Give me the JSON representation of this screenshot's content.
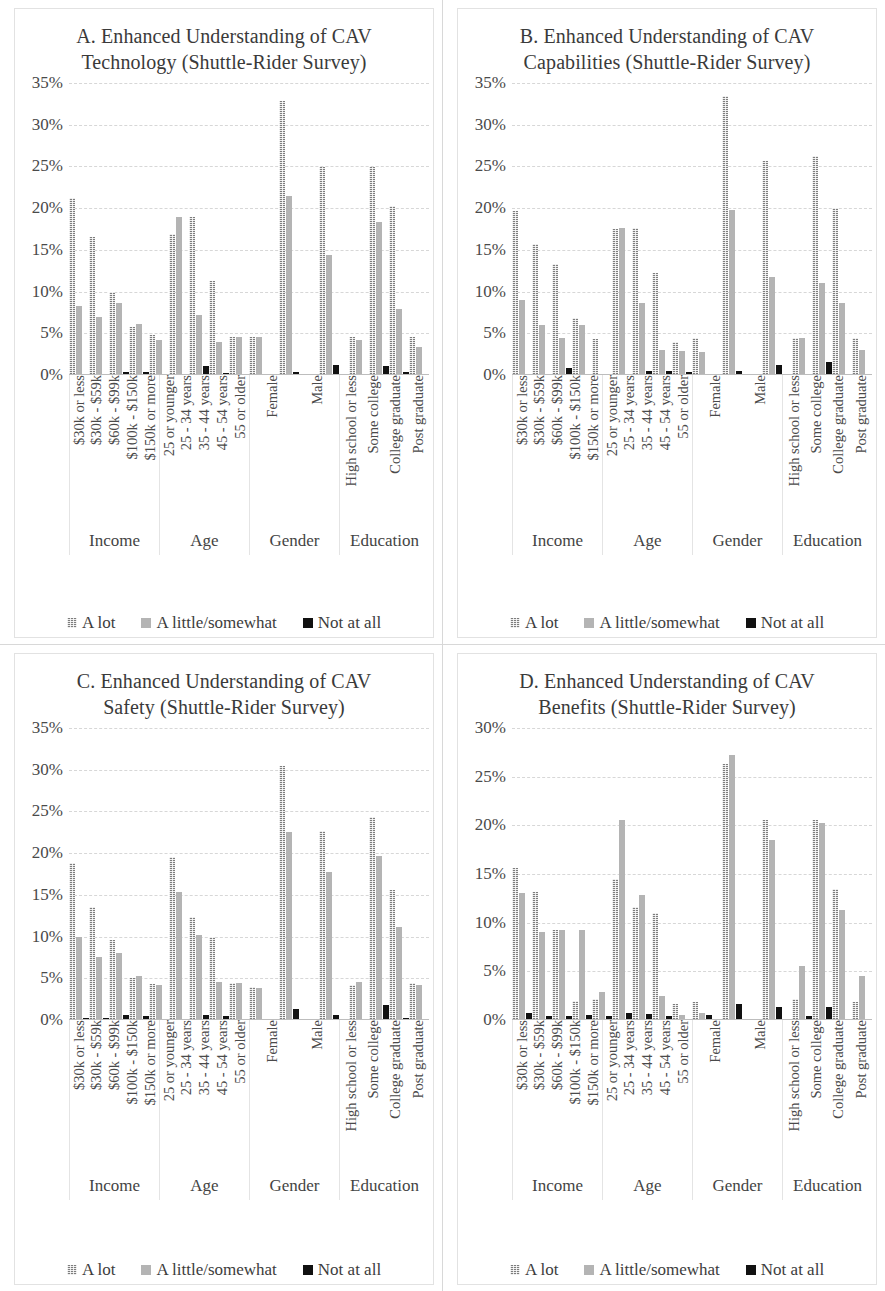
{
  "figure": {
    "legend": [
      {
        "label": "A lot",
        "key": "alot",
        "style": "hatched-gray",
        "color": "#7d7d7d"
      },
      {
        "label": "A little/somewhat",
        "key": "little",
        "style": "solid-light-gray",
        "color": "#b4b4b4"
      },
      {
        "label": "Not at all",
        "key": "none",
        "style": "solid-black",
        "color": "#111111"
      }
    ],
    "groups": [
      {
        "name": "Income",
        "categories": [
          "$30k or less",
          "$30k - $59k",
          "$60k - $99k",
          "$100k - $150k",
          "$150k or more"
        ]
      },
      {
        "name": "Age",
        "categories": [
          "25 or younger",
          "25 - 34 years",
          "35 - 44 years",
          "45 - 54 years",
          "55 or older"
        ]
      },
      {
        "name": "Gender",
        "categories": [
          "Female",
          "Male"
        ]
      },
      {
        "name": "Education",
        "categories": [
          "High school or less",
          "Some college",
          "College graduate",
          "Post graduate"
        ]
      }
    ]
  },
  "chart_data": [
    {
      "id": "A",
      "type": "bar",
      "title": "A. Enhanced Understanding of CAV Technology (Shuttle-Rider Survey)",
      "xlabel": "",
      "ylabel": "",
      "ylim": [
        0,
        35
      ],
      "yticks": [
        "0%",
        "5%",
        "10%",
        "15%",
        "20%",
        "25%",
        "30%",
        "35%"
      ],
      "ytick_values": [
        0,
        5,
        10,
        15,
        20,
        25,
        30,
        35
      ],
      "grid": true,
      "legend_position": "bottom",
      "categories": [
        "$30k or less",
        "$30k - $59k",
        "$60k - $99k",
        "$100k - $150k",
        "$150k or more",
        "25 or younger",
        "25 - 34 years",
        "35 - 44 years",
        "45 - 54 years",
        "55 or older",
        "Female",
        "Male",
        "High school or less",
        "Some college",
        "College graduate",
        "Post graduate"
      ],
      "series": [
        {
          "name": "A lot",
          "values": [
            21.2,
            16.6,
            9.9,
            5.7,
            4.8,
            16.9,
            18.9,
            11.3,
            4.6,
            4.5,
            32.8,
            24.9,
            4.5,
            24.9,
            20.2,
            4.6
          ]
        },
        {
          "name": "A little/somewhat",
          "values": [
            8.3,
            6.9,
            8.6,
            6.1,
            4.2,
            18.9,
            7.2,
            4.0,
            4.5,
            4.6,
            21.5,
            14.4,
            4.2,
            18.3,
            7.9,
            3.3
          ]
        },
        {
          "name": "Not at all",
          "values": [
            0,
            0,
            0.4,
            0.4,
            0,
            0,
            1.1,
            0.3,
            0,
            0,
            0.4,
            1.2,
            0,
            1.1,
            0.4,
            0
          ]
        }
      ]
    },
    {
      "id": "B",
      "type": "bar",
      "title": "B. Enhanced Understanding of CAV Capabilities (Shuttle-Rider Survey)",
      "xlabel": "",
      "ylabel": "",
      "ylim": [
        0,
        35
      ],
      "yticks": [
        "0%",
        "5%",
        "10%",
        "15%",
        "20%",
        "25%",
        "30%",
        "35%"
      ],
      "ytick_values": [
        0,
        5,
        10,
        15,
        20,
        25,
        30,
        35
      ],
      "grid": true,
      "legend_position": "bottom",
      "categories": [
        "$30k or less",
        "$30k - $59k",
        "$60k - $99k",
        "$100k - $150k",
        "$150k or more",
        "25 or younger",
        "25 - 34 years",
        "35 - 44 years",
        "45 - 54 years",
        "55 or older",
        "Female",
        "Male",
        "High school or less",
        "Some college",
        "College graduate",
        "Post graduate"
      ],
      "series": [
        {
          "name": "A lot",
          "values": [
            19.7,
            15.7,
            13.3,
            6.8,
            4.3,
            17.5,
            17.6,
            12.2,
            4.0,
            4.4,
            33.4,
            25.6,
            4.4,
            26.2,
            20.0,
            4.4
          ]
        },
        {
          "name": "A little/somewhat",
          "values": [
            9.0,
            6.0,
            4.4,
            6.0,
            0,
            17.6,
            8.6,
            3.0,
            2.9,
            2.8,
            19.8,
            11.8,
            4.4,
            11.0,
            8.6,
            3.0
          ]
        },
        {
          "name": "Not at all",
          "values": [
            0,
            0,
            0.8,
            0,
            0,
            0,
            0.5,
            0.5,
            0.4,
            0,
            0.5,
            1.2,
            0,
            1.6,
            0,
            0
          ]
        }
      ]
    },
    {
      "id": "C",
      "type": "bar",
      "title": "C. Enhanced Understanding of CAV Safety (Shuttle-Rider Survey)",
      "xlabel": "",
      "ylabel": "",
      "ylim": [
        0,
        35
      ],
      "yticks": [
        "0%",
        "5%",
        "10%",
        "15%",
        "20%",
        "25%",
        "30%",
        "35%"
      ],
      "ytick_values": [
        0,
        5,
        10,
        15,
        20,
        25,
        30,
        35
      ],
      "grid": true,
      "legend_position": "bottom",
      "categories": [
        "$30k or less",
        "$30k - $59k",
        "$60k - $99k",
        "$100k - $150k",
        "$150k or more",
        "25 or younger",
        "25 - 34 years",
        "35 - 44 years",
        "45 - 54 years",
        "55 or older",
        "Female",
        "Male",
        "High school or less",
        "Some college",
        "College graduate",
        "Post graduate"
      ],
      "series": [
        {
          "name": "A lot",
          "values": [
            18.8,
            13.6,
            9.6,
            5.0,
            4.3,
            19.5,
            12.4,
            10.0,
            4.4,
            4.0,
            30.5,
            22.7,
            4.2,
            24.3,
            15.6,
            4.4
          ]
        },
        {
          "name": "A little/somewhat",
          "values": [
            9.9,
            7.6,
            8.0,
            5.3,
            4.2,
            15.3,
            10.2,
            4.5,
            4.4,
            3.8,
            22.5,
            17.7,
            4.5,
            19.7,
            11.2,
            4.2
          ]
        },
        {
          "name": "Not at all",
          "values": [
            0.3,
            0.3,
            0.6,
            0.5,
            0,
            0,
            0.6,
            0.5,
            0,
            0,
            1.3,
            0.6,
            0,
            1.8,
            0.3,
            0
          ]
        }
      ]
    },
    {
      "id": "D",
      "type": "bar",
      "title": "D. Enhanced Understanding of CAV Benefits (Shuttle-Rider Survey)",
      "xlabel": "",
      "ylabel": "",
      "ylim": [
        0,
        30
      ],
      "yticks": [
        "0%",
        "5%",
        "10%",
        "15%",
        "20%",
        "25%",
        "30%"
      ],
      "ytick_values": [
        0,
        5,
        10,
        15,
        20,
        25,
        30
      ],
      "grid": true,
      "legend_position": "bottom",
      "categories": [
        "$30k or less",
        "$30k - $59k",
        "$60k - $99k",
        "$100k - $150k",
        "$150k or more",
        "25 or younger",
        "25 - 34 years",
        "35 - 44 years",
        "45 - 54 years",
        "55 or older",
        "Female",
        "Male",
        "High school or less",
        "Some college",
        "College graduate",
        "Post graduate"
      ],
      "series": [
        {
          "name": "A lot",
          "values": [
            15.6,
            13.2,
            9.2,
            2.0,
            2.2,
            14.5,
            11.6,
            11.0,
            1.6,
            1.8,
            26.3,
            20.5,
            2.2,
            20.5,
            13.5,
            1.8
          ]
        },
        {
          "name": "A little/somewhat",
          "values": [
            13.0,
            9.0,
            9.2,
            9.2,
            2.9,
            20.5,
            12.8,
            2.5,
            0.5,
            0.7,
            27.2,
            18.5,
            5.5,
            20.2,
            11.3,
            4.5
          ]
        },
        {
          "name": "Not at all",
          "values": [
            0.7,
            0.4,
            0.4,
            0.5,
            0.4,
            0.7,
            0.6,
            0.4,
            0,
            0.5,
            1.6,
            1.3,
            0.4,
            1.3,
            0,
            0
          ]
        }
      ]
    }
  ]
}
